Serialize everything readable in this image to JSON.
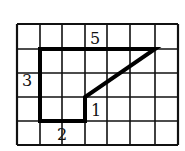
{
  "diagram": {
    "grid": {
      "columns": 7,
      "rows": 5,
      "x_lines": [
        17,
        40,
        62,
        85,
        107,
        130,
        155,
        178
      ],
      "y_lines": [
        24,
        49,
        73,
        97,
        121,
        145
      ],
      "line_color": "#111111"
    },
    "shape": {
      "points": "40,49 155,49 85,97 85,121 40,121",
      "stroke_color": "#000000"
    },
    "labels": [
      {
        "text": "5",
        "x": 90,
        "y": 44
      },
      {
        "text": "3",
        "x": 22,
        "y": 86
      },
      {
        "text": "1",
        "x": 91,
        "y": 116
      },
      {
        "text": "2",
        "x": 57,
        "y": 140
      }
    ]
  }
}
